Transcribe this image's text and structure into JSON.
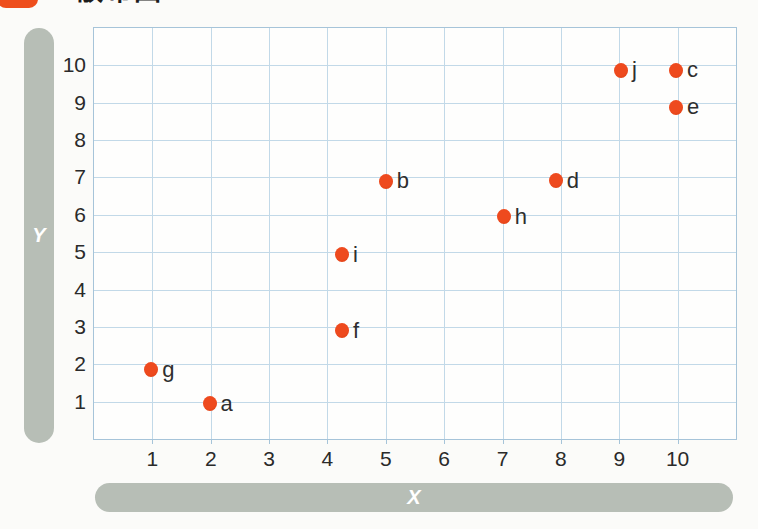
{
  "page": {
    "title": "散布図"
  },
  "chart_data": {
    "type": "scatter",
    "title": "散布図",
    "xlabel": "X",
    "ylabel": "Y",
    "xlim": [
      0,
      11
    ],
    "ylim": [
      0,
      11
    ],
    "x_ticks": [
      1,
      2,
      3,
      4,
      5,
      6,
      7,
      8,
      9,
      10
    ],
    "y_ticks": [
      1,
      2,
      3,
      4,
      5,
      6,
      7,
      8,
      9,
      10
    ],
    "grid": true,
    "legend": "none",
    "points": [
      {
        "label": "a",
        "x": 1.98,
        "y": 0.95
      },
      {
        "label": "b",
        "x": 5.0,
        "y": 6.9
      },
      {
        "label": "c",
        "x": 9.97,
        "y": 9.87
      },
      {
        "label": "d",
        "x": 7.91,
        "y": 6.91
      },
      {
        "label": "e",
        "x": 9.97,
        "y": 8.88
      },
      {
        "label": "f",
        "x": 4.25,
        "y": 2.9
      },
      {
        "label": "g",
        "x": 0.98,
        "y": 1.85
      },
      {
        "label": "h",
        "x": 7.02,
        "y": 5.95
      },
      {
        "label": "i",
        "x": 4.25,
        "y": 4.93
      },
      {
        "label": "j",
        "x": 9.03,
        "y": 9.87
      }
    ],
    "colors": {
      "point": "#ee4a1e",
      "point_edge": "#d93f12",
      "grid": "#c2d9e8",
      "frame": "#a6c4d9",
      "axis_bar": "#b7beb6",
      "axis_bar_text": "#ffffff",
      "tick_label": "#2a2a2a",
      "point_label": "#2e2e2e",
      "title_icon": "#ee4e1c",
      "title_text": "#1c1c1c",
      "background": "#fbfbf9"
    }
  }
}
